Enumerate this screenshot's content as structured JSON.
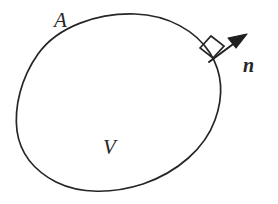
{
  "figure": {
    "kind": "control-volume-diagram",
    "width": 278,
    "height": 204,
    "background_color": "#ffffff",
    "ink_color": "#262626"
  },
  "labels": {
    "surface": "A",
    "volume": "V",
    "normal_vector": "n"
  },
  "annotations": {
    "right_angle_marker": "perpendicular-square",
    "arrow_head": "filled-triangle"
  },
  "geometry": {
    "blob_description": "closed smooth egg-shaped region",
    "blob_path": "M 135 14 C 168 15 196 31 210 53 C 223 74 223 98 215 120 C 205 148 178 172 143 184 C 112 194 80 194 56 182 C 33 170 20 152 17 131 C 14 107 21 78 38 54 C 58 26 98 13 135 14 Z",
    "normal_base": [
      209,
      62
    ],
    "normal_tip": [
      246,
      35
    ],
    "square_marker_center": [
      212,
      47
    ]
  }
}
